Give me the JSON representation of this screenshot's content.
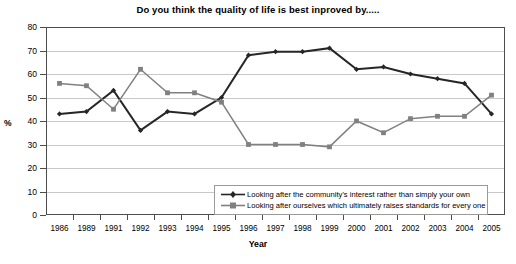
{
  "chart_data": {
    "type": "line",
    "title": "Do you think the quality of life is best inproved by.....",
    "xlabel": "Year",
    "ylabel": "%",
    "ylim": [
      0,
      80
    ],
    "ytick_step": 10,
    "yticks": [
      "0",
      "10",
      "20",
      "30",
      "40",
      "50",
      "60",
      "70",
      "80"
    ],
    "grid": true,
    "legend_position": "bottom-right inside plot",
    "categories": [
      "1986",
      "1989",
      "1991",
      "1992",
      "1993",
      "1994",
      "1995",
      "1996",
      "1997",
      "1998",
      "1999",
      "2000",
      "2001",
      "2002",
      "2003",
      "2004",
      "2005"
    ],
    "series": [
      {
        "name": "Looking after the community's interest rather than simply your own",
        "color": "#262626",
        "marker": "diamond",
        "values": [
          43,
          44,
          53,
          36,
          44,
          43,
          50,
          68,
          69.5,
          69.5,
          71,
          62,
          63,
          60,
          58,
          56,
          43
        ]
      },
      {
        "name": "Looking after ourselves which ultimately raises standards for every one",
        "color": "#808080",
        "marker": "square",
        "values": [
          56,
          55,
          45,
          62,
          52,
          52,
          48,
          30,
          30,
          30,
          29,
          40,
          35,
          41,
          42,
          42,
          51
        ]
      }
    ]
  },
  "legend": {
    "items": [
      {
        "label": "Looking after the community's interest rather than simply your own"
      },
      {
        "label": "Looking after ourselves which ultimately raises standards for every one"
      }
    ]
  },
  "colors": {
    "series_dark": "#262626",
    "series_grey": "#808080",
    "gridline": "#c8c8c8",
    "plot_border": "#4d4d4d",
    "background": "#ffffff"
  }
}
